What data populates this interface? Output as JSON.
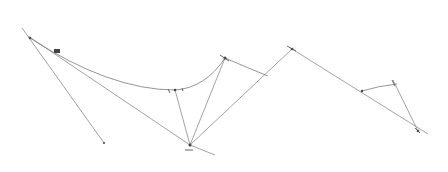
{
  "diagram": {
    "type": "line-sketch",
    "background": "#ffffff",
    "stroke_color": "#8a8a8a",
    "nodes": [
      {
        "id": "A",
        "x": 30,
        "y": 38
      },
      {
        "id": "B",
        "x": 57,
        "y": 52
      },
      {
        "id": "C",
        "x": 175,
        "y": 90
      },
      {
        "id": "D",
        "x": 225,
        "y": 58
      },
      {
        "id": "E",
        "x": 190,
        "y": 145
      },
      {
        "id": "F",
        "x": 292,
        "y": 49
      },
      {
        "id": "G",
        "x": 362,
        "y": 91
      },
      {
        "id": "H",
        "x": 392,
        "y": 84
      },
      {
        "id": "I",
        "x": 418,
        "y": 131
      },
      {
        "id": "J",
        "x": 104,
        "y": 143
      }
    ],
    "lines": [
      {
        "from": "A",
        "to": "J"
      },
      {
        "from": "A",
        "to": "B"
      },
      {
        "from": "C",
        "to": "E"
      },
      {
        "from": "D",
        "to": "E"
      },
      {
        "from": "E",
        "to": "F"
      },
      {
        "from": "F",
        "to": "I"
      },
      {
        "from": "H",
        "to": "I"
      }
    ],
    "curves": [
      {
        "name": "main-arc",
        "from": "B",
        "to": "D"
      },
      {
        "name": "right-arc",
        "from": "D",
        "to": "F"
      },
      {
        "name": "small-arc",
        "from": "G",
        "to": "H"
      }
    ]
  }
}
